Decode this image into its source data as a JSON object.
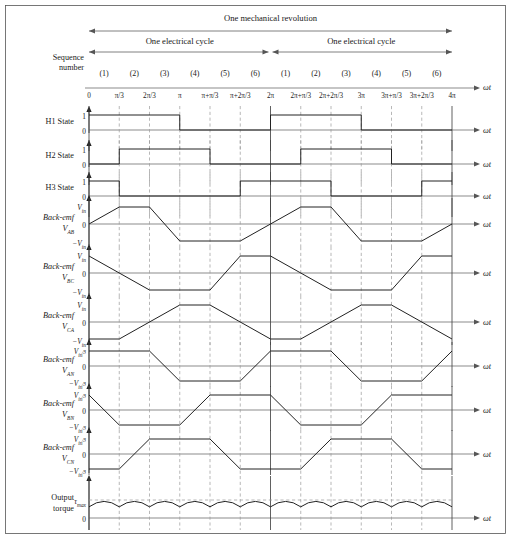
{
  "header": {
    "mechanical_revolution": "One mechanical revolution",
    "electrical_cycle_1": "One electrical cycle",
    "electrical_cycle_2": "One electrical cycle",
    "sequence_label_line1": "Sequence",
    "sequence_label_line2": "number"
  },
  "sequence_numbers": [
    "(1)",
    "(2)",
    "(3)",
    "(4)",
    "(5)",
    "(6)",
    "(1)",
    "(2)",
    "(3)",
    "(4)",
    "(5)",
    "(6)"
  ],
  "x_axis": {
    "label": "ωt",
    "ticks": [
      "0",
      "π/3",
      "2π/3",
      "π",
      "π+π/3",
      "π+2π/3",
      "2π",
      "2π+π/3",
      "2π+2π/3",
      "3π",
      "3π+π/3",
      "3π+2π/3",
      "4π"
    ],
    "range": [
      0,
      12
    ],
    "divisions": 12
  },
  "rows": [
    {
      "name": "h1-state",
      "label_main": "H1 State",
      "label_sub": "",
      "italic": false,
      "ylabels": [
        "1",
        "0"
      ],
      "type": "digital",
      "points": [
        [
          0,
          1
        ],
        [
          3,
          1
        ],
        [
          3,
          0
        ],
        [
          6,
          0
        ],
        [
          6,
          1
        ],
        [
          9,
          1
        ],
        [
          9,
          0
        ],
        [
          12,
          0
        ]
      ]
    },
    {
      "name": "h2-state",
      "label_main": "H2 State",
      "label_sub": "",
      "italic": false,
      "ylabels": [
        "1",
        "0"
      ],
      "type": "digital",
      "points": [
        [
          0,
          0
        ],
        [
          1,
          0
        ],
        [
          1,
          1
        ],
        [
          4,
          1
        ],
        [
          4,
          0
        ],
        [
          7,
          0
        ],
        [
          7,
          1
        ],
        [
          10,
          1
        ],
        [
          10,
          0
        ],
        [
          12,
          0
        ]
      ]
    },
    {
      "name": "h3-state",
      "label_main": "H3 State",
      "label_sub": "",
      "italic": false,
      "ylabels": [
        "1",
        "0"
      ],
      "type": "digital",
      "points": [
        [
          0,
          1
        ],
        [
          1,
          1
        ],
        [
          1,
          0
        ],
        [
          5,
          0
        ],
        [
          5,
          1
        ],
        [
          8,
          1
        ],
        [
          8,
          0
        ],
        [
          11,
          0
        ],
        [
          11,
          1
        ],
        [
          12,
          1
        ]
      ]
    },
    {
      "name": "back-emf-vab",
      "label_main": "Back-emf",
      "label_sub": "V",
      "label_subsub": "AB",
      "italic": true,
      "ylabels": [
        "V_in",
        "0",
        "-V_in"
      ],
      "type": "trapezoid",
      "points": [
        [
          0,
          0
        ],
        [
          1,
          1
        ],
        [
          2,
          1
        ],
        [
          3,
          -1
        ],
        [
          5,
          -1
        ],
        [
          6,
          0
        ],
        [
          7,
          1
        ],
        [
          8,
          1
        ],
        [
          9,
          -1
        ],
        [
          11,
          -1
        ],
        [
          12,
          0
        ]
      ]
    },
    {
      "name": "back-emf-vbc",
      "label_main": "Back-emf",
      "label_sub": "V",
      "label_subsub": "BC",
      "italic": true,
      "ylabels": [
        "V_in",
        "0",
        "-V_in"
      ],
      "type": "trapezoid",
      "points": [
        [
          0,
          1
        ],
        [
          2,
          -1
        ],
        [
          4,
          -1
        ],
        [
          5,
          1
        ],
        [
          6,
          1
        ],
        [
          8,
          -1
        ],
        [
          10,
          -1
        ],
        [
          11,
          1
        ],
        [
          12,
          1
        ]
      ]
    },
    {
      "name": "back-emf-vca",
      "label_main": "Back-emf",
      "label_sub": "V",
      "label_subsub": "CA",
      "italic": true,
      "ylabels": [
        "V_in",
        "0",
        "-V_in"
      ],
      "type": "trapezoid",
      "points": [
        [
          0,
          -1
        ],
        [
          1,
          -1
        ],
        [
          3,
          1
        ],
        [
          4,
          1
        ],
        [
          6,
          -1
        ],
        [
          7,
          -1
        ],
        [
          9,
          1
        ],
        [
          10,
          1
        ],
        [
          12,
          -1
        ]
      ]
    },
    {
      "name": "back-emf-van",
      "label_main": "Back-emf",
      "label_sub": "V",
      "label_subsub": "AN",
      "italic": true,
      "ylabels": [
        "V_in/3",
        "0",
        "-V_in/3"
      ],
      "type": "trapezoid",
      "points": [
        [
          0,
          1
        ],
        [
          2,
          1
        ],
        [
          3,
          -1
        ],
        [
          5,
          -1
        ],
        [
          6,
          1
        ],
        [
          8,
          1
        ],
        [
          9,
          -1
        ],
        [
          11,
          -1
        ],
        [
          12,
          1
        ]
      ]
    },
    {
      "name": "back-emf-vbn",
      "label_main": "Back-emf",
      "label_sub": "V",
      "label_subsub": "BN",
      "italic": true,
      "ylabels": [
        "V_in/3",
        "0",
        "-V_in/3"
      ],
      "type": "trapezoid",
      "points": [
        [
          0,
          1
        ],
        [
          1,
          -1
        ],
        [
          3,
          -1
        ],
        [
          4,
          1
        ],
        [
          6,
          1
        ],
        [
          7,
          -1
        ],
        [
          9,
          -1
        ],
        [
          10,
          1
        ],
        [
          12,
          1
        ]
      ]
    },
    {
      "name": "back-emf-vcn",
      "label_main": "Back-emf",
      "label_sub": "V",
      "label_subsub": "CN",
      "italic": true,
      "ylabels": [
        "V_in/3",
        "0",
        "-V_in/3"
      ],
      "type": "trapezoid",
      "points": [
        [
          0,
          -1
        ],
        [
          1,
          -1
        ],
        [
          2,
          1
        ],
        [
          4,
          1
        ],
        [
          5,
          -1
        ],
        [
          7,
          -1
        ],
        [
          8,
          1
        ],
        [
          10,
          1
        ],
        [
          11,
          -1
        ],
        [
          12,
          -1
        ]
      ]
    },
    {
      "name": "output-torque",
      "label_main": "Output",
      "label_sub": "torque",
      "italic": false,
      "ylabels": [
        "τmax",
        "0"
      ],
      "type": "torque",
      "arcs": 12,
      "peak": "τmax"
    }
  ],
  "symbols": {
    "v_in": "V",
    "v_in_sub": "in",
    "minus": "−",
    "tau_max": "τ",
    "tau_max_sub": "max",
    "three": "3"
  },
  "colors": {
    "waveform": "#222222",
    "grid": "#9a9a9a",
    "axis": "#777777",
    "text": "#1a1a1a"
  }
}
